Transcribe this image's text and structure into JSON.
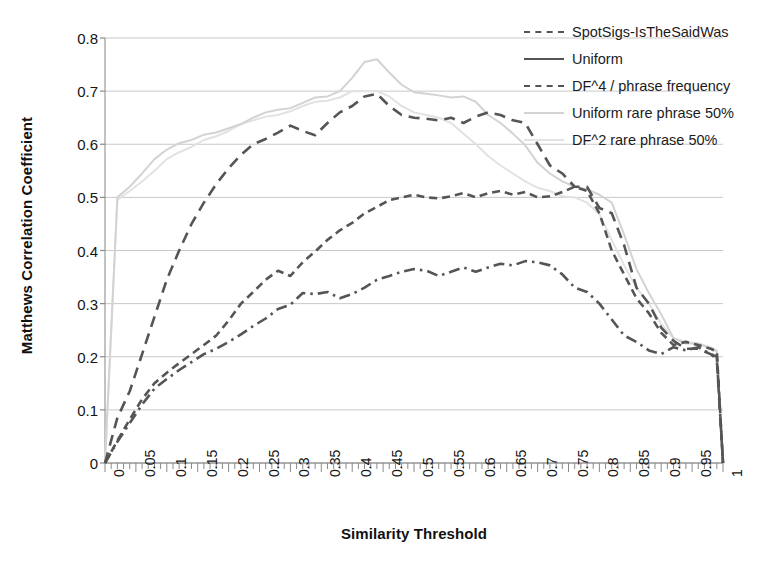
{
  "chart_data": {
    "type": "line",
    "title": "",
    "xlabel": "Similarity Threshold",
    "ylabel": "Matthews Correlation Coefficient",
    "xlim": [
      0,
      1
    ],
    "ylim": [
      0,
      0.8
    ],
    "grid": "horizontal",
    "legend_position": "top-right",
    "xticks": [
      "0",
      "0.05",
      "0.1",
      "0.15",
      "0.2",
      "0.25",
      "0.3",
      "0.35",
      "0.4",
      "0.45",
      "0.5",
      "0.55",
      "0.6",
      "0.65",
      "0.7",
      "0.75",
      "0.8",
      "0.85",
      "0.9",
      "0.95",
      "1"
    ],
    "yticks": [
      "0",
      "0.1",
      "0.2",
      "0.3",
      "0.4",
      "0.5",
      "0.6",
      "0.7",
      "0.8"
    ],
    "x": [
      0,
      0.02,
      0.04,
      0.06,
      0.08,
      0.1,
      0.12,
      0.14,
      0.16,
      0.18,
      0.2,
      0.22,
      0.24,
      0.26,
      0.28,
      0.3,
      0.32,
      0.34,
      0.36,
      0.38,
      0.4,
      0.42,
      0.44,
      0.46,
      0.48,
      0.5,
      0.52,
      0.54,
      0.56,
      0.58,
      0.6,
      0.62,
      0.64,
      0.66,
      0.68,
      0.7,
      0.72,
      0.74,
      0.76,
      0.78,
      0.8,
      0.82,
      0.84,
      0.86,
      0.88,
      0.9,
      0.92,
      0.94,
      0.96,
      0.98,
      0.99,
      1.0
    ],
    "series": [
      {
        "name": "SpotSigs-IsTheSaidWas",
        "color": "#555555",
        "style": "dashed",
        "width": 2.6,
        "values": [
          0,
          0.085,
          0.135,
          0.205,
          0.275,
          0.345,
          0.4,
          0.45,
          0.49,
          0.525,
          0.555,
          0.58,
          0.6,
          0.61,
          0.622,
          0.635,
          0.625,
          0.617,
          0.64,
          0.66,
          0.672,
          0.69,
          0.695,
          0.672,
          0.655,
          0.65,
          0.648,
          0.645,
          0.65,
          0.64,
          0.652,
          0.66,
          0.655,
          0.645,
          0.64,
          0.6,
          0.56,
          0.545,
          0.52,
          0.52,
          0.48,
          0.47,
          0.41,
          0.33,
          0.3,
          0.255,
          0.23,
          0.215,
          0.215,
          0.205,
          0.195,
          0.0
        ]
      },
      {
        "name": "Uniform",
        "color": "#555555",
        "style": "dashdot",
        "width": 2.6,
        "values": [
          0,
          0.04,
          0.075,
          0.11,
          0.14,
          0.158,
          0.175,
          0.19,
          0.205,
          0.215,
          0.228,
          0.242,
          0.258,
          0.272,
          0.29,
          0.298,
          0.32,
          0.318,
          0.322,
          0.31,
          0.318,
          0.33,
          0.345,
          0.352,
          0.36,
          0.365,
          0.362,
          0.352,
          0.36,
          0.368,
          0.36,
          0.368,
          0.375,
          0.372,
          0.38,
          0.378,
          0.372,
          0.355,
          0.33,
          0.322,
          0.3,
          0.27,
          0.24,
          0.228,
          0.212,
          0.205,
          0.218,
          0.212,
          0.218,
          0.205,
          0.2,
          0.0
        ]
      },
      {
        "name": "DF^4 / phrase frequency",
        "color": "#555555",
        "style": "dashed-short",
        "width": 2.6,
        "values": [
          0,
          0.042,
          0.082,
          0.12,
          0.15,
          0.17,
          0.188,
          0.205,
          0.222,
          0.24,
          0.268,
          0.3,
          0.322,
          0.345,
          0.362,
          0.352,
          0.378,
          0.398,
          0.42,
          0.438,
          0.452,
          0.47,
          0.482,
          0.495,
          0.5,
          0.505,
          0.5,
          0.498,
          0.502,
          0.508,
          0.5,
          0.508,
          0.512,
          0.505,
          0.51,
          0.5,
          0.502,
          0.51,
          0.52,
          0.512,
          0.47,
          0.4,
          0.355,
          0.31,
          0.282,
          0.245,
          0.222,
          0.228,
          0.222,
          0.215,
          0.21,
          0.0
        ]
      },
      {
        "name": "Uniform rare phrase 50%",
        "color": "#d3d3d3",
        "style": "solid",
        "width": 2.0,
        "values": [
          0,
          0.5,
          0.52,
          0.545,
          0.572,
          0.59,
          0.602,
          0.608,
          0.618,
          0.622,
          0.63,
          0.638,
          0.65,
          0.66,
          0.665,
          0.668,
          0.678,
          0.688,
          0.69,
          0.7,
          0.725,
          0.755,
          0.76,
          0.735,
          0.712,
          0.698,
          0.695,
          0.692,
          0.688,
          0.69,
          0.68,
          0.655,
          0.64,
          0.62,
          0.598,
          0.565,
          0.545,
          0.53,
          0.52,
          0.515,
          0.505,
          0.49,
          0.43,
          0.365,
          0.32,
          0.28,
          0.235,
          0.225,
          0.225,
          0.215,
          0.21,
          0.0
        ]
      },
      {
        "name": "DF^2 rare phrase 50%",
        "color": "#e2e2e2",
        "style": "solid",
        "width": 2.0,
        "values": [
          0,
          0.495,
          0.512,
          0.53,
          0.55,
          0.572,
          0.585,
          0.595,
          0.608,
          0.615,
          0.625,
          0.638,
          0.645,
          0.652,
          0.655,
          0.662,
          0.672,
          0.68,
          0.682,
          0.688,
          0.7,
          0.7,
          0.7,
          0.69,
          0.672,
          0.66,
          0.655,
          0.65,
          0.64,
          0.62,
          0.6,
          0.578,
          0.56,
          0.545,
          0.53,
          0.518,
          0.512,
          0.502,
          0.5,
          0.49,
          0.468,
          0.42,
          0.372,
          0.33,
          0.3,
          0.262,
          0.235,
          0.228,
          0.225,
          0.218,
          0.212,
          0.0
        ]
      }
    ]
  },
  "legend": {
    "items": [
      {
        "label": "SpotSigs-IsTheSaidWas"
      },
      {
        "label": "Uniform"
      },
      {
        "label": "DF^4 / phrase frequency"
      },
      {
        "label": "Uniform rare phrase 50%"
      },
      {
        "label": "DF^2 rare phrase 50%"
      }
    ]
  }
}
